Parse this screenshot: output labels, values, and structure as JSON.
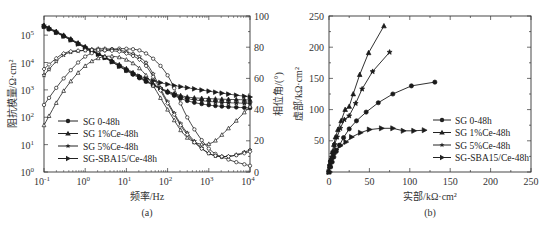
{
  "chart_data": [
    {
      "id": "a",
      "type": "line",
      "caption": "(a)",
      "title": "",
      "xlabel": "频率/Hz",
      "ylabel": "阻抗模量/Ω·cm²",
      "ylabel_right": "相位角/(°)",
      "xscale": "log",
      "yscale": "log",
      "xlim": [
        0.1,
        10000
      ],
      "ylim": [
        1,
        500000
      ],
      "ylim_right": [
        0,
        100
      ],
      "x_ticks": [
        "10⁻¹",
        "10⁰",
        "10¹",
        "10²",
        "10³",
        "10⁴"
      ],
      "y_ticks": [
        "10⁰",
        "10¹",
        "10²",
        "10³",
        "10⁴",
        "10⁵"
      ],
      "y_right_ticks": [
        "0",
        "20",
        "40",
        "60",
        "80",
        "100"
      ],
      "grid": false,
      "legend_position": "lower left",
      "legend": [
        "SG 0-48h",
        "SG 1%Ce-48h",
        "SG 5%Ce-48h",
        "SG-SBA15/Ce-48h"
      ],
      "x": [
        0.1,
        0.3,
        1,
        3,
        10,
        30,
        100,
        300,
        1000,
        3000,
        10000
      ],
      "series": [
        {
          "name": "SG 0-48h |Z|",
          "axis": "left",
          "marker": "circle-filled",
          "values": [
            200000,
            90000,
            35000,
            15000,
            5000,
            2000,
            800,
            400,
            280,
            240,
            220
          ]
        },
        {
          "name": "SG 1%Ce-48h |Z|",
          "axis": "left",
          "marker": "triangle-filled",
          "values": [
            230000,
            100000,
            38000,
            16000,
            6000,
            2200,
            900,
            550,
            480,
            450,
            430
          ]
        },
        {
          "name": "SG 5%Ce-48h |Z|",
          "axis": "left",
          "marker": "star-filled",
          "values": [
            220000,
            95000,
            36000,
            15500,
            5500,
            2100,
            850,
            480,
            380,
            340,
            320
          ]
        },
        {
          "name": "SG-SBA15/Ce-48h |Z|",
          "axis": "left",
          "marker": "right-triangle-filled",
          "values": [
            210000,
            92000,
            34000,
            15000,
            5200,
            2600,
            1600,
            1200,
            900,
            700,
            550
          ]
        },
        {
          "name": "SG 0-48h phase",
          "axis": "right",
          "marker": "circle-open",
          "values": [
            43,
            60,
            74,
            78,
            79,
            76,
            62,
            35,
            15,
            8,
            4
          ]
        },
        {
          "name": "SG 1%Ce-48h phase",
          "axis": "right",
          "marker": "triangle-open",
          "values": [
            30,
            52,
            68,
            74,
            72,
            62,
            40,
            22,
            18,
            28,
            42
          ]
        },
        {
          "name": "SG 5%Ce-48h phase",
          "axis": "right",
          "marker": "star-open",
          "values": [
            62,
            75,
            78,
            79,
            77,
            70,
            45,
            25,
            12,
            10,
            14
          ]
        },
        {
          "name": "SG-SBA15/Ce-48h phase",
          "axis": "right",
          "marker": "diamond-open",
          "values": [
            66,
            76,
            78,
            78,
            76,
            68,
            44,
            24,
            12,
            10,
            13
          ]
        }
      ]
    },
    {
      "id": "b",
      "type": "line",
      "caption": "(b)",
      "title": "",
      "xlabel": "实部/kΩ·cm²",
      "ylabel": "虚部/kΩ·cm²",
      "xlim": [
        0,
        250
      ],
      "ylim": [
        0,
        250
      ],
      "x_ticks": [
        "0",
        "50",
        "100",
        "150",
        "200",
        "250"
      ],
      "y_ticks": [
        "50",
        "100",
        "150",
        "200",
        "250"
      ],
      "grid": false,
      "legend_position": "center right",
      "legend": [
        "SG 0-48h",
        "SG 1%Ce-48h",
        "SG 5%Ce-48h",
        "SG-SBA15/Ce-48h"
      ],
      "series": [
        {
          "name": "SG 0-48h",
          "marker": "circle-filled",
          "x": [
            0,
            2,
            4,
            6,
            9,
            13,
            18,
            25,
            34,
            46,
            61,
            79,
            102,
            131
          ],
          "y": [
            0,
            8,
            16,
            24,
            33,
            43,
            55,
            69,
            82,
            96,
            111,
            125,
            138,
            144
          ]
        },
        {
          "name": "SG 1%Ce-48h",
          "marker": "triangle-filled",
          "x": [
            0,
            1,
            2,
            4,
            6,
            8,
            11,
            15,
            20,
            25,
            30,
            38,
            49,
            68
          ],
          "y": [
            0,
            10,
            20,
            32,
            44,
            56,
            68,
            82,
            100,
            105,
            125,
            156,
            191,
            234
          ]
        },
        {
          "name": "SG 5%Ce-48h",
          "marker": "star-filled",
          "x": [
            0,
            1,
            3,
            5,
            7,
            10,
            14,
            19,
            25,
            33,
            41,
            54,
            75
          ],
          "y": [
            0,
            10,
            20,
            32,
            44,
            56,
            70,
            84,
            90,
            110,
            133,
            161,
            192
          ]
        },
        {
          "name": "SG-SBA15/Ce-48h",
          "marker": "right-triangle-filled",
          "x": [
            0,
            1,
            2,
            4,
            6,
            9,
            14,
            21,
            28,
            39,
            50,
            65,
            79,
            92,
            105,
            118
          ],
          "y": [
            0,
            8,
            15,
            22,
            29,
            36,
            42,
            48,
            56,
            63,
            68,
            70,
            70,
            66,
            66,
            67
          ]
        }
      ]
    }
  ],
  "chart_a": {
    "caption": "(a)",
    "xlabel": "频率/Hz",
    "ylabel": "阻抗模量/Ω·cm²",
    "ylabel_right": "相位角/(°)",
    "legend": [
      "SG 0-48h",
      "SG 1%Ce-48h",
      "SG 5%Ce-48h",
      "SG-SBA15/Ce-48h"
    ],
    "x_ticks": [
      {
        "base": "10",
        "exp": "-1"
      },
      {
        "base": "10",
        "exp": "0"
      },
      {
        "base": "10",
        "exp": "1"
      },
      {
        "base": "10",
        "exp": "2"
      },
      {
        "base": "10",
        "exp": "3"
      },
      {
        "base": "10",
        "exp": "4"
      }
    ],
    "y_ticks": [
      {
        "base": "10",
        "exp": "0"
      },
      {
        "base": "10",
        "exp": "1"
      },
      {
        "base": "10",
        "exp": "2"
      },
      {
        "base": "10",
        "exp": "3"
      },
      {
        "base": "10",
        "exp": "4"
      },
      {
        "base": "10",
        "exp": "5"
      }
    ],
    "y_right_ticks": [
      "0",
      "20",
      "40",
      "60",
      "80",
      "100"
    ]
  },
  "chart_b": {
    "caption": "(b)",
    "xlabel": "实部/kΩ·cm²",
    "ylabel": "虚部/kΩ·cm²",
    "legend": [
      "SG 0-48h",
      "SG 1%Ce-48h",
      "SG 5%Ce-48h",
      "SG-SBA15/Ce-48h"
    ],
    "x_ticks": [
      "0",
      "50",
      "100",
      "150",
      "200",
      "250"
    ],
    "y_ticks": [
      "50",
      "100",
      "150",
      "200",
      "250"
    ]
  },
  "colors": {
    "line": "#1a1a1a",
    "axis": "#333333",
    "background": "#ffffff"
  }
}
